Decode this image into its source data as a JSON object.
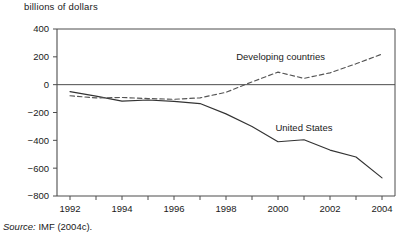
{
  "figure": {
    "axis_title": "billions of dollars",
    "source_label": "Source:",
    "source_text": " IMF (2004c)."
  },
  "chart_data": {
    "type": "line",
    "title": "billions of dollars",
    "xlabel": "",
    "ylabel": "billions of dollars",
    "xlim": [
      1991.5,
      2004.5
    ],
    "ylim": [
      -800,
      400
    ],
    "ytick_values": [
      400,
      200,
      0,
      -200,
      -400,
      -600,
      -800
    ],
    "ytick_labels": [
      "400",
      "200",
      "0",
      "-200",
      "-400",
      "-600",
      "-800"
    ],
    "xtick_values": [
      1992,
      1993,
      1994,
      1995,
      1996,
      1997,
      1998,
      1999,
      2000,
      2001,
      2002,
      2003,
      2004
    ],
    "xtick_labels": [
      "1992",
      "",
      "1994",
      "",
      "1996",
      "",
      "1998",
      "",
      "2000",
      "",
      "2002",
      "",
      "2004"
    ],
    "grid": false,
    "zero_line": true,
    "legend": "inline-annotation",
    "x": [
      1992,
      1993,
      1994,
      1995,
      1996,
      1997,
      1998,
      1999,
      2000,
      2001,
      2002,
      2003,
      2004
    ],
    "series": [
      {
        "name": "United States",
        "style": "solid",
        "color": "#333333",
        "label_x": 2001.0,
        "label_y": -330,
        "values": [
          -50,
          -82,
          -118,
          -110,
          -120,
          -136,
          -210,
          -300,
          -410,
          -396,
          -470,
          -520,
          -670
        ]
      },
      {
        "name": "Developing countries",
        "style": "dashed",
        "color": "#555555",
        "label_x": 2000.1,
        "label_y": 175,
        "values": [
          -80,
          -95,
          -92,
          -100,
          -105,
          -95,
          -55,
          20,
          90,
          45,
          85,
          150,
          220
        ]
      }
    ]
  }
}
